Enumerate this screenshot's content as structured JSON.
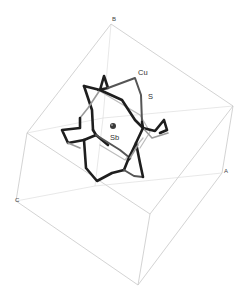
{
  "figure": {
    "type": "crystal-structure-unit-cell",
    "axes": {
      "a_label": "A",
      "b_label": "B",
      "c_label": "C"
    },
    "atoms": {
      "cu_label": "Cu",
      "s_label": "S",
      "sb_label": "Sb"
    },
    "colors": {
      "cell_edge": "#c8c8c8",
      "bond_dark": "#1e1e1e",
      "bond_light": "#9a9a9a",
      "sb_atom": "#3a3a3a",
      "background": "#ffffff"
    }
  }
}
